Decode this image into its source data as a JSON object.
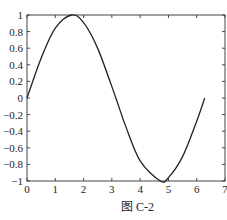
{
  "chart_data": {
    "type": "line",
    "title": "",
    "caption": "图 C-2",
    "xlabel": "",
    "ylabel": "",
    "xlim": [
      0,
      7
    ],
    "ylim": [
      -1,
      1
    ],
    "grid": false,
    "legend": null,
    "x_ticks": [
      0,
      1,
      2,
      3,
      4,
      5,
      6,
      7
    ],
    "y_ticks": [
      -1,
      -0.8,
      -0.6,
      -0.4,
      -0.2,
      0,
      0.2,
      0.4,
      0.6,
      0.8,
      1
    ],
    "x_tick_labels": [
      "0",
      "1",
      "2",
      "3",
      "4",
      "5",
      "6",
      "7"
    ],
    "y_tick_labels": [
      "−1",
      "−0.8",
      "−0.6",
      "−0.4",
      "−0.2",
      "0",
      "0.2",
      "0.4",
      "0.6",
      "0.8",
      "1"
    ],
    "series": [
      {
        "name": "sin(x)",
        "color": "#222222",
        "x": [
          0,
          0.5,
          1.0,
          1.5708,
          2.0,
          2.5,
          3.1416,
          3.5,
          4.0,
          4.7124,
          5.0,
          5.5,
          6.0,
          6.2832
        ],
        "y": [
          0,
          0.479,
          0.841,
          1.0,
          0.909,
          0.598,
          0,
          -0.351,
          -0.757,
          -1.0,
          -0.959,
          -0.706,
          -0.279,
          0
        ]
      }
    ]
  },
  "figure": {
    "caption": "图 C-2"
  }
}
